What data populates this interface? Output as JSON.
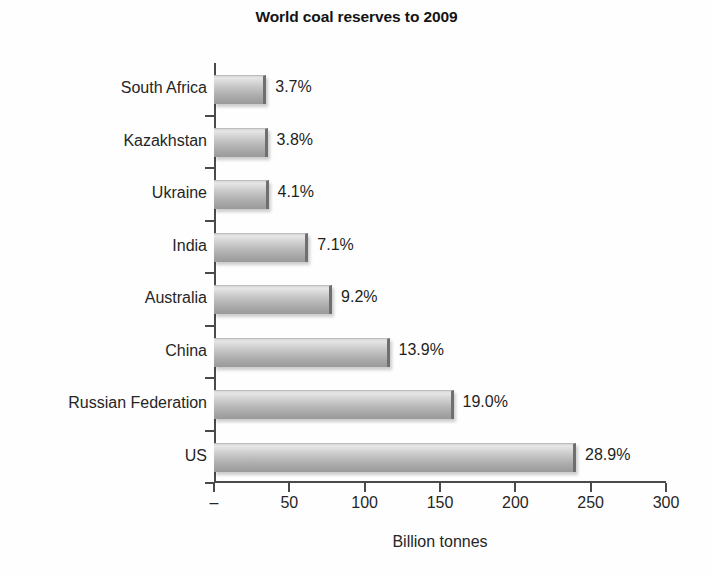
{
  "chart_data": {
    "type": "bar",
    "orientation": "horizontal",
    "title": "World coal reserves to 2009",
    "xlabel": "Billion tonnes",
    "ylabel": "",
    "xlim": [
      0,
      300
    ],
    "xticks": [
      "–",
      "50",
      "100",
      "150",
      "200",
      "250",
      "300"
    ],
    "xtick_values": [
      0,
      50,
      100,
      150,
      200,
      250,
      300
    ],
    "grid": false,
    "legend": false,
    "categories": [
      "South Africa",
      "Kazakhstan",
      "Ukraine",
      "India",
      "Australia",
      "China",
      "Russian Federation",
      "US"
    ],
    "values": [
      32.7,
      33.6,
      34.2,
      60.6,
      76.4,
      114.5,
      157.0,
      238.3
    ],
    "data_labels": [
      "3.7%",
      "3.8%",
      "4.1%",
      "7.1%",
      "9.2%",
      "13.9%",
      "19.0%",
      "28.9%"
    ],
    "percent_values": [
      3.7,
      3.8,
      4.1,
      7.1,
      9.2,
      13.9,
      19.0,
      28.9
    ],
    "colors": {
      "bar_light": "#e6e6e6",
      "bar_dark": "#9a9a9a",
      "bar_edge": "#6f6f6f",
      "axis": "#4a4a4a",
      "text": "#262626",
      "background": "#ffffff"
    }
  }
}
